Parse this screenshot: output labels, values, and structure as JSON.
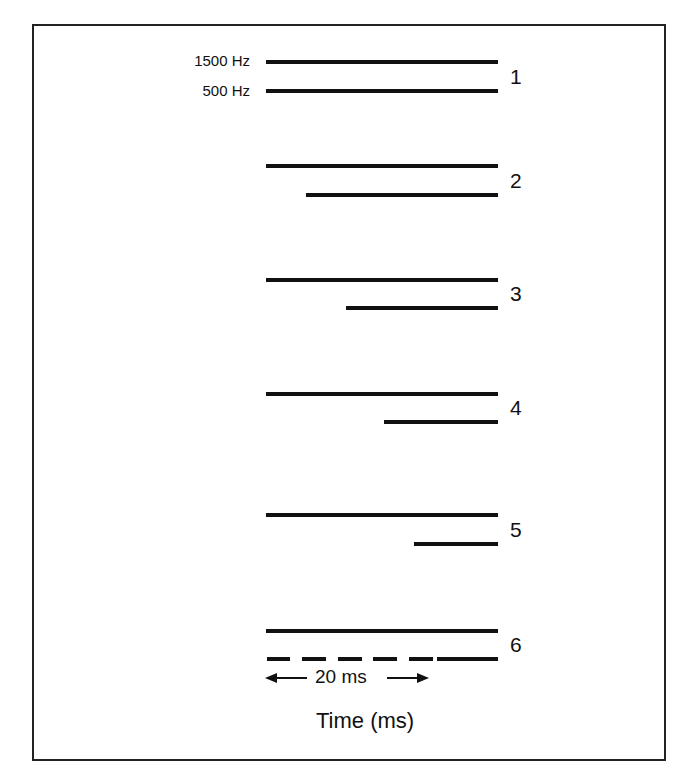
{
  "figure": {
    "freq_labels": [
      "1500 Hz",
      "500 Hz"
    ],
    "conditions": [
      {
        "label": "1",
        "upper": {
          "start_x": 266,
          "end_x": 498,
          "y": 60
        },
        "lower": {
          "start_x": 266,
          "end_x": 498,
          "y": 89
        },
        "lower_style": "solid"
      },
      {
        "label": "2",
        "upper": {
          "start_x": 266,
          "end_x": 498,
          "y": 164
        },
        "lower": {
          "start_x": 306,
          "end_x": 498,
          "y": 193
        },
        "lower_style": "solid"
      },
      {
        "label": "3",
        "upper": {
          "start_x": 266,
          "end_x": 498,
          "y": 278
        },
        "lower": {
          "start_x": 346,
          "end_x": 498,
          "y": 306
        },
        "lower_style": "solid"
      },
      {
        "label": "4",
        "upper": {
          "start_x": 266,
          "end_x": 498,
          "y": 392
        },
        "lower": {
          "start_x": 384,
          "end_x": 498,
          "y": 420
        },
        "lower_style": "solid"
      },
      {
        "label": "5",
        "upper": {
          "start_x": 266,
          "end_x": 498,
          "y": 513
        },
        "lower": {
          "start_x": 414,
          "end_x": 498,
          "y": 542
        },
        "lower_style": "solid"
      },
      {
        "label": "6",
        "upper": {
          "start_x": 266,
          "end_x": 498,
          "y": 629
        },
        "lower": {
          "start_x": 266,
          "end_x": 498,
          "y": 657
        },
        "lower_style": "dashed"
      }
    ],
    "scale_bar": {
      "label": "20 ms",
      "left_arrow": "←",
      "right_arrow": "→"
    },
    "x_axis_label": "Time (ms)",
    "line_color": "#111111",
    "border_color": "#222222"
  }
}
